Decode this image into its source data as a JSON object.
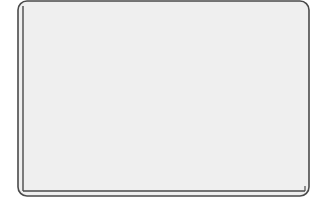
{
  "chart_data": {
    "type": "line",
    "title": "",
    "xlabel": "",
    "ylabel": "",
    "legend": [],
    "grid": false,
    "y_ticks_count": 10,
    "x_ticks_count": 0,
    "series": [
      {
        "name": "curve",
        "color": "#3a3a3a",
        "points_px": [
          [
            43,
            8
          ],
          [
            45,
            35
          ],
          [
            47,
            60
          ],
          [
            51,
            82
          ],
          [
            55,
            100
          ],
          [
            60,
            114
          ],
          [
            65,
            125
          ],
          [
            72,
            136
          ],
          [
            80,
            145
          ],
          [
            90,
            153
          ],
          [
            100,
            160
          ],
          [
            115,
            165
          ],
          [
            130,
            170
          ],
          [
            150,
            173
          ],
          [
            170,
            176
          ],
          [
            195,
            178
          ],
          [
            220,
            179
          ],
          [
            260,
            180
          ],
          [
            300,
            181
          ]
        ]
      }
    ],
    "normalized": {
      "x": [
        0.0,
        0.007,
        0.014,
        0.027,
        0.041,
        0.058,
        0.075,
        0.099,
        0.126,
        0.16,
        0.194,
        0.245,
        0.296,
        0.364,
        0.432,
        0.517,
        0.602,
        0.738,
        0.874
      ],
      "y": [
        0.96,
        0.81,
        0.68,
        0.56,
        0.46,
        0.39,
        0.33,
        0.27,
        0.22,
        0.18,
        0.14,
        0.11,
        0.09,
        0.07,
        0.05,
        0.04,
        0.04,
        0.03,
        0.03
      ]
    }
  },
  "colors": {
    "panel_bg": "#efefef",
    "frame": "#4a4a4a",
    "curve": "#3a3a3a"
  }
}
